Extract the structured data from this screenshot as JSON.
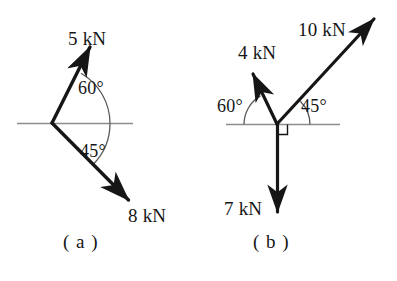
{
  "figure": {
    "type": "free-body-force-diagram",
    "background_color": "#ffffff",
    "stroke_color": "#161616",
    "axis_color": "#8c8c8c",
    "diagrams": [
      {
        "id": "a",
        "caption": "( a )",
        "origin": {
          "x": 52,
          "y": 123
        },
        "axis_line": {
          "x1": 17,
          "y1": 123,
          "x2": 133,
          "y2": 123
        },
        "forces": [
          {
            "name": "force-5kn",
            "label": "5 kN",
            "magnitude": 5,
            "unit": "kN",
            "angle_deg_from_positive_x": 60,
            "direction": "up-right",
            "tip": {
              "x": 92,
              "y": 44
            },
            "label_pos": {
              "x": 68,
              "y": 29
            }
          },
          {
            "name": "force-8kn",
            "label": "8 kN",
            "magnitude": 8,
            "unit": "kN",
            "angle_deg_from_positive_x": -45,
            "direction": "down-right",
            "tip": {
              "x": 134,
              "y": 206
            },
            "label_pos": {
              "x": 128,
              "y": 206
            }
          }
        ],
        "angles": [
          {
            "name": "angle-60",
            "label": "60°",
            "value": 60,
            "measured_from": "horizontal-axis",
            "toward": "5 kN",
            "label_pos": {
              "x": 78,
              "y": 79
            },
            "arc_radius": 58
          },
          {
            "name": "angle-45",
            "label": "45°",
            "value": 45,
            "measured_from": "horizontal-axis",
            "toward": "8 kN",
            "label_pos": {
              "x": 80,
              "y": 142
            },
            "arc_radius": 58
          }
        ],
        "caption_pos": {
          "x": 63,
          "y": 232
        }
      },
      {
        "id": "b",
        "caption": "( b )",
        "origin": {
          "x": 277,
          "y": 124
        },
        "axis_line": {
          "x1": 226,
          "y1": 124,
          "x2": 340,
          "y2": 124
        },
        "right_angle_marker": true,
        "forces": [
          {
            "name": "force-10kn",
            "label": "10 kN",
            "magnitude": 10,
            "unit": "kN",
            "angle_deg_from_positive_x": 45,
            "direction": "up-right",
            "tip": {
              "x": 379,
              "y": 15
            },
            "label_pos": {
              "x": 298,
              "y": 20
            }
          },
          {
            "name": "force-4kn",
            "label": "4 kN",
            "magnitude": 4,
            "unit": "kN",
            "angle_deg_from_positive_x": 120,
            "direction": "up-left",
            "tip": {
              "x": 249,
              "y": 69
            },
            "label_pos": {
              "x": 238,
              "y": 43
            }
          },
          {
            "name": "force-7kn",
            "label": "7 kN",
            "magnitude": 7,
            "unit": "kN",
            "angle_deg_from_positive_x": -90,
            "direction": "down",
            "tip": {
              "x": 277,
              "y": 219
            },
            "label_pos": {
              "x": 224,
              "y": 199
            }
          }
        ],
        "angles": [
          {
            "name": "angle-60",
            "label": "60°",
            "value": 60,
            "measured_from": "horizontal-axis",
            "toward": "4 kN",
            "label_pos": {
              "x": 217,
              "y": 97
            },
            "arc_radius": 33
          },
          {
            "name": "angle-45",
            "label": "45°",
            "value": 45,
            "measured_from": "horizontal-axis",
            "toward": "10 kN",
            "label_pos": {
              "x": 301,
              "y": 97
            },
            "arc_radius": 33
          }
        ],
        "caption_pos": {
          "x": 253,
          "y": 232
        }
      }
    ]
  }
}
